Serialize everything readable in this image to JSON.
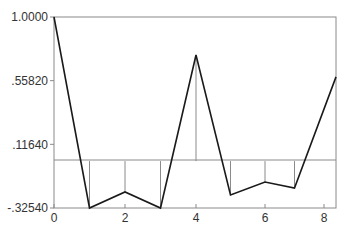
{
  "chart_data": {
    "type": "line",
    "title": "",
    "xlabel": "",
    "ylabel": "",
    "xlim": [
      0,
      8.4
    ],
    "ylim": [
      -0.3254,
      1.0
    ],
    "grid": false,
    "legend": null,
    "x_ticks": [
      "0",
      "2",
      "4",
      "6",
      "8"
    ],
    "y_ticks": [
      "1.0000",
      ".55820",
      ".11640",
      "-.32540"
    ],
    "baseline": 0,
    "stems": true,
    "series": [
      {
        "name": "sequence",
        "x": [
          0,
          1,
          2,
          3,
          4,
          5,
          6,
          7,
          8.4
        ],
        "values": [
          1.0,
          -0.3254,
          -0.214,
          -0.3254,
          0.736,
          -0.235,
          -0.145,
          -0.187,
          0.584
        ]
      }
    ],
    "colors": {
      "line": "#1a1a1a",
      "axis": "#8a8a8a",
      "stem": "#8a8a8a"
    }
  }
}
